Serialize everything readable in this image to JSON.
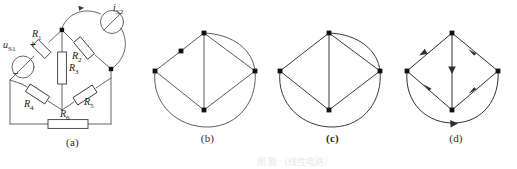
{
  "figure": {
    "caption_ghost": "图 题  （线性电路）",
    "panels": [
      {
        "key": "a",
        "caption": "(a)",
        "kind": "circuit-diagram"
      },
      {
        "key": "b",
        "caption": "(b)",
        "kind": "undirected-graph"
      },
      {
        "key": "c",
        "caption": "(c)",
        "kind": "undirected-graph"
      },
      {
        "key": "d",
        "caption": "(d)",
        "kind": "directed-graph"
      }
    ]
  },
  "circuit": {
    "source_voltage": {
      "symbol": "u",
      "subscript": "S1",
      "plus": "+",
      "minus": "−"
    },
    "source_current": {
      "symbol": "i",
      "subscript": "S2"
    },
    "resistors": [
      {
        "symbol": "R",
        "subscript": "1"
      },
      {
        "symbol": "R",
        "subscript": "2"
      },
      {
        "symbol": "R",
        "subscript": "3"
      },
      {
        "symbol": "R",
        "subscript": "4"
      },
      {
        "symbol": "R",
        "subscript": "5"
      },
      {
        "symbol": "R",
        "subscript": "6"
      }
    ]
  },
  "colors": {
    "ink": "#1a1a1a",
    "line": "#555555",
    "node": "#111111",
    "paper": "#ffffff"
  },
  "graph_b": {
    "nodes": [
      {
        "id": "top",
        "x": 59,
        "y": 33
      },
      {
        "id": "left",
        "x": 10,
        "y": 71
      },
      {
        "id": "right",
        "x": 110,
        "y": 71
      },
      {
        "id": "bot",
        "x": 59,
        "y": 110
      },
      {
        "id": "mid-upper-left",
        "x": 36,
        "y": 51
      }
    ],
    "straight_edges": [
      [
        "top",
        "mid-upper-left"
      ],
      [
        "mid-upper-left",
        "left"
      ],
      [
        "top",
        "right"
      ],
      [
        "left",
        "bot"
      ],
      [
        "bot",
        "right"
      ],
      [
        "top",
        "bot"
      ]
    ],
    "arc_edges": [
      {
        "from": "top",
        "to": "right",
        "bulge": "outer-right"
      },
      {
        "from": "left",
        "to": "right",
        "bulge": "outer-bottom"
      }
    ]
  },
  "graph_c": {
    "nodes": [
      {
        "id": "top",
        "x": 59,
        "y": 33
      },
      {
        "id": "left",
        "x": 10,
        "y": 71
      },
      {
        "id": "right",
        "x": 110,
        "y": 71
      },
      {
        "id": "bot",
        "x": 59,
        "y": 110
      }
    ],
    "straight_edges": [
      [
        "top",
        "left"
      ],
      [
        "top",
        "right"
      ],
      [
        "left",
        "bot"
      ],
      [
        "bot",
        "right"
      ],
      [
        "top",
        "bot"
      ]
    ],
    "arc_edges": [
      {
        "from": "top",
        "to": "right",
        "bulge": "outer-right"
      },
      {
        "from": "left",
        "to": "right",
        "bulge": "outer-bottom"
      }
    ]
  },
  "graph_d": {
    "nodes": [
      {
        "id": "top",
        "x": 57,
        "y": 33
      },
      {
        "id": "left",
        "x": 12,
        "y": 71
      },
      {
        "id": "right",
        "x": 103,
        "y": 71
      },
      {
        "id": "bot",
        "x": 57,
        "y": 110
      }
    ],
    "directed_edges": [
      {
        "from": "top",
        "to": "left",
        "arrow": "mid"
      },
      {
        "from": "top",
        "to": "right",
        "arrow": "mid"
      },
      {
        "from": "top",
        "to": "bot",
        "arrow": "mid"
      },
      {
        "from": "left",
        "to": "bot",
        "arrow": "mid"
      },
      {
        "from": "bot",
        "to": "right",
        "arrow": "mid"
      },
      {
        "from": "left",
        "to": "right",
        "arrow": "mid",
        "shape": "arc-bottom"
      }
    ]
  }
}
